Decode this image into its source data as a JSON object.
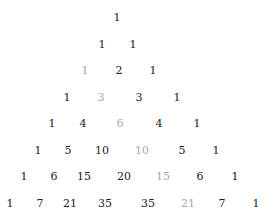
{
  "colors": {
    "normal": "#222222",
    "highlight": "#a8a8a8",
    "background": "#ffffff"
  },
  "rows": [
    {
      "y": 18,
      "cells": [
        {
          "v": "1",
          "x": 117,
          "gray": false
        }
      ]
    },
    {
      "y": 45,
      "cells": [
        {
          "v": "1",
          "x": 102,
          "gray": false
        },
        {
          "v": "1",
          "x": 133,
          "gray": false
        }
      ]
    },
    {
      "y": 71,
      "cells": [
        {
          "v": "1",
          "x": 85,
          "gray": true
        },
        {
          "v": "2",
          "x": 119,
          "gray": false
        },
        {
          "v": "1",
          "x": 153,
          "gray": false
        }
      ]
    },
    {
      "y": 98,
      "cells": [
        {
          "v": "1",
          "x": 67,
          "gray": false
        },
        {
          "v": "3",
          "x": 101,
          "gray": true
        },
        {
          "v": "3",
          "x": 139,
          "gray": false
        },
        {
          "v": "1",
          "x": 177,
          "gray": false
        }
      ]
    },
    {
      "y": 124,
      "cells": [
        {
          "v": "1",
          "x": 52,
          "gray": false
        },
        {
          "v": "4",
          "x": 83,
          "gray": false
        },
        {
          "v": "6",
          "x": 120,
          "gray": true
        },
        {
          "v": "4",
          "x": 159,
          "gray": false
        },
        {
          "v": "1",
          "x": 197,
          "gray": false
        }
      ]
    },
    {
      "y": 151,
      "cells": [
        {
          "v": "1",
          "x": 38,
          "gray": false
        },
        {
          "v": "5",
          "x": 68,
          "gray": false
        },
        {
          "v": "10",
          "x": 102,
          "gray": false
        },
        {
          "v": "10",
          "x": 142,
          "gray": true
        },
        {
          "v": "5",
          "x": 182,
          "gray": false
        },
        {
          "v": "1",
          "x": 216,
          "gray": false
        }
      ]
    },
    {
      "y": 177,
      "cells": [
        {
          "v": "1",
          "x": 24,
          "gray": false
        },
        {
          "v": "6",
          "x": 54,
          "gray": false
        },
        {
          "v": "15",
          "x": 84,
          "gray": false
        },
        {
          "v": "20",
          "x": 124,
          "gray": false
        },
        {
          "v": "15",
          "x": 163,
          "gray": true
        },
        {
          "v": "6",
          "x": 200,
          "gray": false
        },
        {
          "v": "1",
          "x": 235,
          "gray": false
        }
      ]
    },
    {
      "y": 204,
      "cells": [
        {
          "v": "1",
          "x": 10,
          "gray": false
        },
        {
          "v": "7",
          "x": 40,
          "gray": false
        },
        {
          "v": "21",
          "x": 70,
          "gray": false
        },
        {
          "v": "35",
          "x": 105,
          "gray": false
        },
        {
          "v": "35",
          "x": 148,
          "gray": false
        },
        {
          "v": "21",
          "x": 188,
          "gray": true
        },
        {
          "v": "7",
          "x": 222,
          "gray": false
        },
        {
          "v": "1",
          "x": 256,
          "gray": false
        }
      ]
    }
  ]
}
